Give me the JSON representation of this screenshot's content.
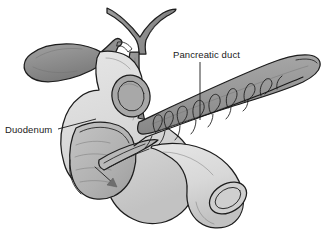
{
  "figure": {
    "style": "grayscale line drawing with cutaway",
    "background_color": "#ffffff",
    "width": 328,
    "height": 232
  },
  "labels": [
    {
      "id": "pancreatic-duct",
      "text": "Pancreatic duct",
      "x": 173,
      "y": 58,
      "anchor": "start",
      "leader": {
        "x1": 200,
        "y1": 62,
        "x2": 200,
        "y2": 120
      }
    },
    {
      "id": "duodenum",
      "text": "Duodenum",
      "x": 5,
      "y": 133,
      "anchor": "start",
      "leader": {
        "x1": 58,
        "y1": 129,
        "x2": 96,
        "y2": 119
      }
    }
  ],
  "structures": [
    {
      "id": "gallbladder",
      "name": "Gallbladder",
      "fill": "#8d8d8d"
    },
    {
      "id": "pancreas",
      "name": "Pancreas body and tail",
      "fill": "#9a9a9a"
    },
    {
      "id": "duodenum-body",
      "name": "Duodenum",
      "fill": "#d8d8d8"
    },
    {
      "id": "duodenum-lumen",
      "name": "Duodenal lumen cutaway",
      "fill": "#b4b4b4"
    },
    {
      "id": "common-bile-duct",
      "name": "Common bile duct",
      "fill": "#8f8f8f"
    },
    {
      "id": "hepatic-ducts",
      "name": "Hepatic ducts",
      "fill": "#8f8f8f"
    },
    {
      "id": "pancreatic-duct-tree",
      "name": "Pancreatic duct with side branches",
      "stroke": "#191919"
    },
    {
      "id": "ampulla-arrow",
      "name": "Flow arrow into duodenal lumen",
      "fill": "#6e6e6e"
    }
  ],
  "colors": {
    "outline": "#1d1d1d",
    "gallbladder": "#8d8d8d",
    "pancreas": "#9a9a9a",
    "duodenum": "#d8d8d8",
    "lumen": "#b4b4b4",
    "duct": "#8f8f8f",
    "text": "#1a1a1a"
  }
}
